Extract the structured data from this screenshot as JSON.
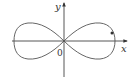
{
  "diagram": {
    "type": "lemniscate-curve",
    "axes": {
      "x_label": "x",
      "y_label": "y",
      "origin_label": "0"
    },
    "colors": {
      "axis": "#444444",
      "curve": "#555555",
      "point": "#333333"
    },
    "marked_point": true
  }
}
